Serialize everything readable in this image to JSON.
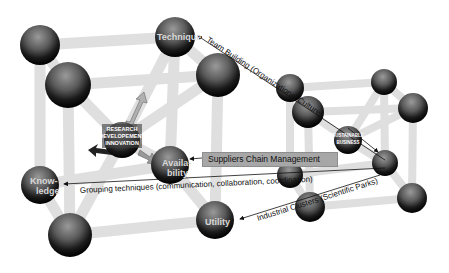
{
  "diagram": {
    "type": "3d-molecular-lattice-concept-map",
    "left_cube": {
      "hub": {
        "lines": [
          "RESEARCH",
          "DEVELOPEMENT",
          "INNOVATION"
        ]
      },
      "nodes": {
        "technique": "Technique",
        "knowledge": [
          "Know-",
          "ledge"
        ],
        "availability": [
          "Availa-",
          "bility"
        ],
        "utility": "Utility"
      }
    },
    "right_cube": {
      "hub": {
        "lines": [
          "SUSTAINABLE",
          "BUSINESS"
        ]
      }
    },
    "connections": [
      {
        "label": "Team Building (Organizational Culture)",
        "from": "Technique",
        "to": "right-cube-node"
      },
      {
        "label": "Suppliers Chain Management",
        "from": "right-cube-node",
        "to": "Availability"
      },
      {
        "label": "Grouping techniques (communication, collaboration, coordination)",
        "from": "right-cube-node",
        "to": "Knowledge"
      },
      {
        "label": "Industrial Clusters (Scientific Parks)",
        "from": "right-cube-node",
        "to": "Utility"
      }
    ],
    "colors": {
      "sphere_dark": "#111111",
      "sphere_mid": "#6a6a6a",
      "rod": "#e2e2e2",
      "box": "#a7a7a7"
    }
  }
}
